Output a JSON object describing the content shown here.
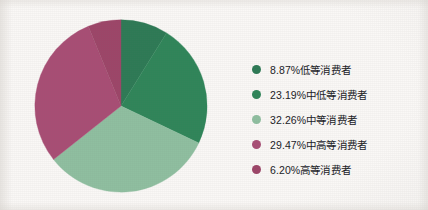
{
  "chart_data": {
    "type": "pie",
    "title": "",
    "subtitle": "",
    "xlabel": "",
    "ylabel": "",
    "legend_position": "right",
    "grid": false,
    "start_angle_deg": 0,
    "direction": "clockwise",
    "units": "percent",
    "total": 100.0,
    "categories": [
      "低等消费者",
      "中低等消费者",
      "中等消费者",
      "中高等消费者",
      "高等消费者"
    ],
    "values": [
      8.87,
      23.19,
      32.26,
      29.47,
      6.2
    ],
    "labels": [
      "8.87%低等消费者",
      "23.19%中低等消费者",
      "32.26%中等消费者",
      "29.47%中高等消费者",
      "6.20%高等消费者"
    ],
    "colors": [
      "#2d7a55",
      "#2f8559",
      "#8fbfa0",
      "#a84d74",
      "#9d4568"
    ],
    "slices": [
      {
        "label": "8.87%低等消费者",
        "category": "低等消费者",
        "value": 8.87,
        "color": "#2d7a55"
      },
      {
        "label": "23.19%中低等消费者",
        "category": "中低等消费者",
        "value": 23.19,
        "color": "#2f8559"
      },
      {
        "label": "32.26%中等消费者",
        "category": "中等消费者",
        "value": 32.26,
        "color": "#8fbfa0"
      },
      {
        "label": "29.47%中高等消费者",
        "category": "中高等消费者",
        "value": 29.47,
        "color": "#a84d74"
      },
      {
        "label": "6.20%高等消费者",
        "category": "高等消费者",
        "value": 6.2,
        "color": "#9d4568"
      }
    ]
  },
  "legend": {
    "items": [
      {
        "label": "8.87%低等消费者",
        "color": "#2d7a55"
      },
      {
        "label": "23.19%中低等消费者",
        "color": "#2f8559"
      },
      {
        "label": "32.26%中等消费者",
        "color": "#8fbfa0"
      },
      {
        "label": "29.47%中高等消费者",
        "color": "#a84d74"
      },
      {
        "label": "6.20%高等消费者",
        "color": "#9d4568"
      }
    ]
  },
  "theme": {
    "background": "#faf8f6",
    "text": "#20201f"
  }
}
